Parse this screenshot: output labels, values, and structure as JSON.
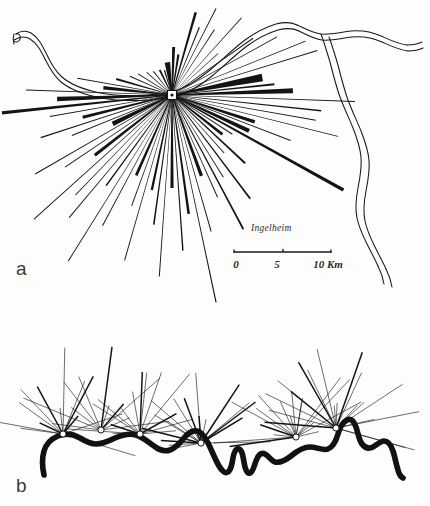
{
  "figure": {
    "background_color": "#fdfdfd",
    "ink_color": "#141414",
    "panels": [
      {
        "id": "a",
        "label": "a",
        "label_x": 16,
        "label_y": 275,
        "place_label": "Ingelheim",
        "place_label_x": 251,
        "place_label_y": 231,
        "hub": {
          "x": 172,
          "y": 95,
          "marker": "white-square-with-dot"
        }
      },
      {
        "id": "b",
        "label": "b",
        "label_x": 16,
        "label_y": 492
      }
    ],
    "scalebar": {
      "x1": 234,
      "x2": 331,
      "y": 252,
      "ticks": [
        {
          "label": "0",
          "x": 236,
          "y": 268
        },
        {
          "label": "5",
          "x": 277,
          "y": 268
        },
        {
          "label": "10 Km",
          "x": 310,
          "y": 268
        }
      ]
    }
  },
  "chart_data": {
    "type": "scatter",
    "title": "Ingelheim",
    "xlabel": "",
    "ylabel": "",
    "legend": [],
    "annotations": [
      "a",
      "b",
      "Ingelheim",
      "0",
      "5",
      "10 Km"
    ],
    "scale_km_per_unit": {
      "pixels": 97,
      "kilometres": 10
    },
    "panel_a": {
      "description": "Radial spoke diagram centred on Ingelheim with the river Rhine drawn as a double outline; spoke thickness encodes magnitude of link.",
      "hub": {
        "x": 172,
        "y": 95
      },
      "rays": [
        {
          "angle_deg": 262,
          "length": 33,
          "width": 5.5
        },
        {
          "angle_deg": 272,
          "length": 48,
          "width": 3.0
        },
        {
          "angle_deg": 279,
          "length": 41,
          "width": 2.2
        },
        {
          "angle_deg": 286,
          "length": 86,
          "width": 2.6
        },
        {
          "angle_deg": 292,
          "length": 73,
          "width": 1.2
        },
        {
          "angle_deg": 297,
          "length": 97,
          "width": 1.0
        },
        {
          "angle_deg": 303,
          "length": 78,
          "width": 1.0
        },
        {
          "angle_deg": 312,
          "length": 104,
          "width": 1.0
        },
        {
          "angle_deg": 318,
          "length": 62,
          "width": 0.8
        },
        {
          "angle_deg": 325,
          "length": 99,
          "width": 1.0
        },
        {
          "angle_deg": 331,
          "length": 120,
          "width": 0.9
        },
        {
          "angle_deg": 338,
          "length": 144,
          "width": 0.8
        },
        {
          "angle_deg": 343,
          "length": 152,
          "width": 1.0
        },
        {
          "angle_deg": 349,
          "length": 92,
          "width": 7.5
        },
        {
          "angle_deg": 354,
          "length": 103,
          "width": 2.0
        },
        {
          "angle_deg": 358,
          "length": 121,
          "width": 5.0
        },
        {
          "angle_deg": 2,
          "length": 183,
          "width": 1.0
        },
        {
          "angle_deg": 6,
          "length": 150,
          "width": 1.4
        },
        {
          "angle_deg": 10,
          "length": 146,
          "width": 1.0
        },
        {
          "angle_deg": 14,
          "length": 171,
          "width": 1.0
        },
        {
          "angle_deg": 18,
          "length": 87,
          "width": 3.6
        },
        {
          "angle_deg": 21,
          "length": 127,
          "width": 1.0
        },
        {
          "angle_deg": 25,
          "length": 85,
          "width": 4.2
        },
        {
          "angle_deg": 29,
          "length": 196,
          "width": 3.4
        },
        {
          "angle_deg": 33,
          "length": 72,
          "width": 1.0
        },
        {
          "angle_deg": 38,
          "length": 64,
          "width": 2.8
        },
        {
          "angle_deg": 43,
          "length": 100,
          "width": 2.0
        },
        {
          "angle_deg": 48,
          "length": 78,
          "width": 1.0
        },
        {
          "angle_deg": 53,
          "length": 130,
          "width": 1.8
        },
        {
          "angle_deg": 58,
          "length": 97,
          "width": 1.0
        },
        {
          "angle_deg": 62,
          "length": 152,
          "width": 1.8
        },
        {
          "angle_deg": 66,
          "length": 112,
          "width": 1.0
        },
        {
          "angle_deg": 70,
          "length": 86,
          "width": 3.4
        },
        {
          "angle_deg": 74,
          "length": 142,
          "width": 1.0
        },
        {
          "angle_deg": 78,
          "length": 212,
          "width": 1.2
        },
        {
          "angle_deg": 82,
          "length": 120,
          "width": 2.6
        },
        {
          "angle_deg": 86,
          "length": 156,
          "width": 1.4
        },
        {
          "angle_deg": 90,
          "length": 93,
          "width": 3.2
        },
        {
          "angle_deg": 94,
          "length": 182,
          "width": 1.0
        },
        {
          "angle_deg": 98,
          "length": 131,
          "width": 1.6
        },
        {
          "angle_deg": 102,
          "length": 97,
          "width": 2.4
        },
        {
          "angle_deg": 106,
          "length": 172,
          "width": 1.0
        },
        {
          "angle_deg": 110,
          "length": 118,
          "width": 1.0
        },
        {
          "angle_deg": 114,
          "length": 88,
          "width": 2.8
        },
        {
          "angle_deg": 118,
          "length": 148,
          "width": 1.0
        },
        {
          "angle_deg": 122,
          "length": 196,
          "width": 1.0
        },
        {
          "angle_deg": 126,
          "length": 112,
          "width": 1.6
        },
        {
          "angle_deg": 130,
          "length": 160,
          "width": 1.0
        },
        {
          "angle_deg": 134,
          "length": 139,
          "width": 1.0
        },
        {
          "angle_deg": 138,
          "length": 186,
          "width": 1.0
        },
        {
          "angle_deg": 142,
          "length": 98,
          "width": 3.2
        },
        {
          "angle_deg": 146,
          "length": 129,
          "width": 1.0
        },
        {
          "angle_deg": 150,
          "length": 158,
          "width": 1.0
        },
        {
          "angle_deg": 154,
          "length": 66,
          "width": 4.6
        },
        {
          "angle_deg": 158,
          "length": 108,
          "width": 1.0
        },
        {
          "angle_deg": 162,
          "length": 138,
          "width": 1.2
        },
        {
          "angle_deg": 166,
          "length": 92,
          "width": 3.0
        },
        {
          "angle_deg": 170,
          "length": 124,
          "width": 1.0
        },
        {
          "angle_deg": 174,
          "length": 171,
          "width": 3.2
        },
        {
          "angle_deg": 178,
          "length": 115,
          "width": 4.6
        },
        {
          "angle_deg": 182,
          "length": 146,
          "width": 1.0
        },
        {
          "angle_deg": 186,
          "length": 69,
          "width": 3.4
        },
        {
          "angle_deg": 190,
          "length": 96,
          "width": 1.0
        },
        {
          "angle_deg": 196,
          "length": 58,
          "width": 2.2
        },
        {
          "angle_deg": 204,
          "length": 46,
          "width": 1.0
        },
        {
          "angle_deg": 212,
          "length": 40,
          "width": 1.0
        },
        {
          "angle_deg": 222,
          "length": 34,
          "width": 1.0
        },
        {
          "angle_deg": 232,
          "length": 30,
          "width": 1.0
        },
        {
          "angle_deg": 244,
          "length": 28,
          "width": 2.0
        },
        {
          "angle_deg": 253,
          "length": 26,
          "width": 1.4
        }
      ]
    },
    "panel_b": {
      "description": "Six riverside nodes along the Rhine, each with its own fan of radiating links; river drawn as a single heavy meandering line.",
      "nodes": [
        {
          "index": 1,
          "x": 63,
          "y": 434,
          "rays": 13
        },
        {
          "index": 2,
          "x": 101,
          "y": 430,
          "rays": 11
        },
        {
          "index": 3,
          "x": 140,
          "y": 434,
          "rays": 14
        },
        {
          "index": 4,
          "x": 201,
          "y": 443,
          "rays": 18
        },
        {
          "index": 5,
          "x": 296,
          "y": 437,
          "rays": 17
        },
        {
          "index": 6,
          "x": 336,
          "y": 428,
          "rays": 19
        }
      ]
    }
  }
}
